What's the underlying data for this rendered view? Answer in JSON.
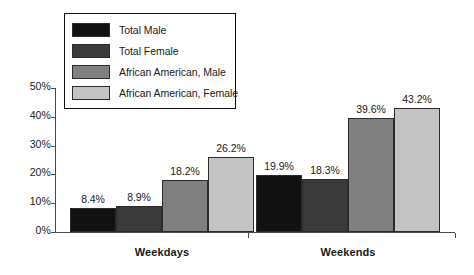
{
  "chart_data": {
    "type": "bar",
    "title": "",
    "subtitle": "",
    "xlabel": "",
    "ylabel": "",
    "categories": [
      "Weekdays",
      "Weekends"
    ],
    "series": [
      {
        "name": "Total Male",
        "color": "#111111",
        "values": [
          8.4,
          19.9
        ]
      },
      {
        "name": "Total Female",
        "color": "#3a3a3a",
        "values": [
          8.9,
          18.3
        ]
      },
      {
        "name": "African American, Male",
        "color": "#808080",
        "values": [
          18.2,
          39.6
        ]
      },
      {
        "name": "African American, Female",
        "color": "#c4c4c4",
        "values": [
          26.2,
          43.2
        ]
      }
    ],
    "value_labels": [
      [
        "8.4%",
        "8.9%",
        "18.2%",
        "26.2%"
      ],
      [
        "19.9%",
        "18.3%",
        "39.6%",
        "43.2%"
      ]
    ],
    "ylim": [
      0,
      50
    ],
    "ytick_values": [
      0,
      10,
      20,
      30,
      40,
      50
    ],
    "ytick_labels": [
      "0%",
      "10%",
      "20%",
      "30%",
      "40%",
      "50%"
    ],
    "grid": false,
    "legend_position": "upper-left-inside",
    "axis_color": "#4a4a4a",
    "bar_outline_color": "#2b2b2b",
    "background": "#ffffff"
  },
  "legend": {
    "items": [
      {
        "label": "Total Male"
      },
      {
        "label": "Total Female"
      },
      {
        "label": "African American, Male"
      },
      {
        "label": "African American, Female"
      }
    ]
  }
}
